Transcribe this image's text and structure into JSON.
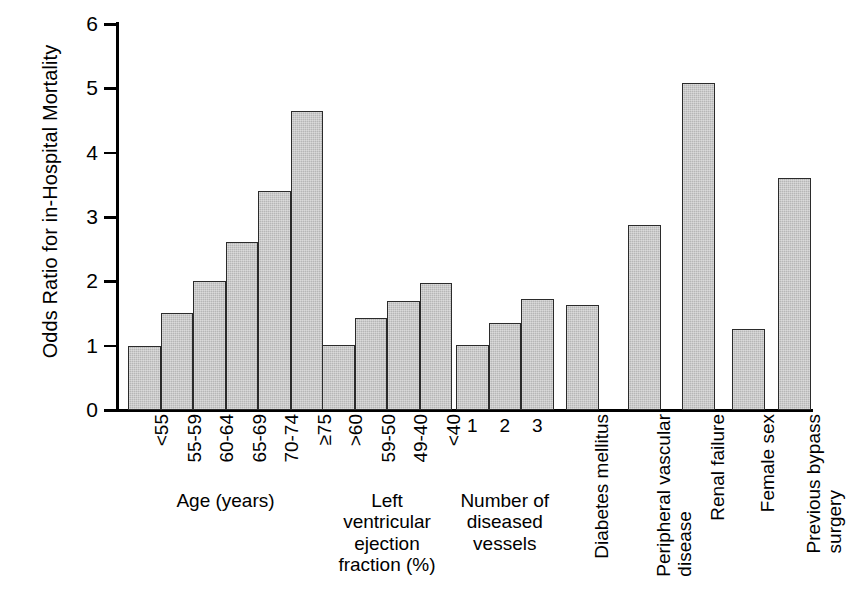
{
  "figure": {
    "ylabel": "Odds Ratio for in-Hospital Mortality",
    "corner_mark": ""
  },
  "y_axis": {
    "ticks": [
      "0",
      "1",
      "2",
      "3",
      "4",
      "5",
      "6"
    ]
  },
  "groups": [
    {
      "caption": "Age (years)",
      "caption_orientation": "horizontal",
      "tick_orientation": "vertical",
      "items": [
        {
          "label": "<55",
          "value": 1.0
        },
        {
          "label": "55-59",
          "value": 1.51
        },
        {
          "label": "60-64",
          "value": 2.0
        },
        {
          "label": "65-69",
          "value": 2.61
        },
        {
          "label": "70-74",
          "value": 3.4
        },
        {
          "label": "≥75",
          "value": 4.65
        }
      ]
    },
    {
      "caption": "Left\nventricular\nejection\nfraction (%)",
      "caption_orientation": "horizontal",
      "tick_orientation": "vertical",
      "items": [
        {
          "label": ">60",
          "value": 1.01
        },
        {
          "label": "59-50",
          "value": 1.43
        },
        {
          "label": "49-40",
          "value": 1.69
        },
        {
          "label": "<40",
          "value": 1.97
        }
      ]
    },
    {
      "caption": "Number of\ndiseased\nvessels",
      "caption_orientation": "horizontal",
      "tick_orientation": "horizontal",
      "items": [
        {
          "label": "1",
          "value": 1.01
        },
        {
          "label": "2",
          "value": 1.36
        },
        {
          "label": "3",
          "value": 1.72
        }
      ]
    },
    {
      "caption": "",
      "caption_orientation": "none",
      "tick_orientation": "none",
      "items": [
        {
          "label": "Diabetes mellitus",
          "value": 1.63
        }
      ]
    },
    {
      "caption": "",
      "caption_orientation": "none",
      "tick_orientation": "none",
      "items": [
        {
          "label": "Peripheral vascular\ndisease",
          "value": 2.87
        }
      ]
    },
    {
      "caption": "",
      "caption_orientation": "none",
      "tick_orientation": "none",
      "items": [
        {
          "label": "Renal failure",
          "value": 5.08
        }
      ]
    },
    {
      "caption": "",
      "caption_orientation": "none",
      "tick_orientation": "none",
      "items": [
        {
          "label": "Female sex",
          "value": 1.26
        }
      ]
    },
    {
      "caption": "",
      "caption_orientation": "none",
      "tick_orientation": "none",
      "items": [
        {
          "label": "Previous bypass\nsurgery",
          "value": 3.61
        }
      ]
    }
  ],
  "chart_data": {
    "type": "bar",
    "title": "",
    "subtitle": "",
    "xlabel": "",
    "ylabel": "Odds Ratio for in-Hospital Mortality",
    "ylim": [
      0,
      6
    ],
    "yticks": [
      0,
      1,
      2,
      3,
      4,
      5,
      6
    ],
    "grid": false,
    "legend": null,
    "bar_color": "#b6b6b6",
    "bar_edge_color": "#2b2b2b",
    "groups": [
      {
        "name": "Age (years)",
        "categories": [
          "<55",
          "55-59",
          "60-64",
          "65-69",
          "70-74",
          "≥75"
        ],
        "values": [
          1.0,
          1.51,
          2.0,
          2.61,
          3.4,
          4.65
        ]
      },
      {
        "name": "Left ventricular ejection fraction (%)",
        "categories": [
          ">60",
          "59-50",
          "49-40",
          "<40"
        ],
        "values": [
          1.01,
          1.43,
          1.69,
          1.97
        ]
      },
      {
        "name": "Number of diseased vessels",
        "categories": [
          "1",
          "2",
          "3"
        ],
        "values": [
          1.01,
          1.36,
          1.72
        ]
      },
      {
        "name": "Other risk factors",
        "categories": [
          "Diabetes mellitus",
          "Peripheral vascular disease",
          "Renal failure",
          "Female sex",
          "Previous bypass surgery"
        ],
        "values": [
          1.63,
          2.87,
          5.08,
          1.26,
          3.61
        ]
      }
    ],
    "categories": [
      "<55",
      "55-59",
      "60-64",
      "65-69",
      "70-74",
      "≥75",
      ">60",
      "59-50",
      "49-40",
      "<40",
      "1",
      "2",
      "3",
      "Diabetes mellitus",
      "Peripheral vascular disease",
      "Renal failure",
      "Female sex",
      "Previous bypass surgery"
    ],
    "values": [
      1.0,
      1.51,
      2.0,
      2.61,
      3.4,
      4.65,
      1.01,
      1.43,
      1.69,
      1.97,
      1.01,
      1.36,
      1.72,
      1.63,
      2.87,
      5.08,
      1.26,
      3.61
    ]
  }
}
